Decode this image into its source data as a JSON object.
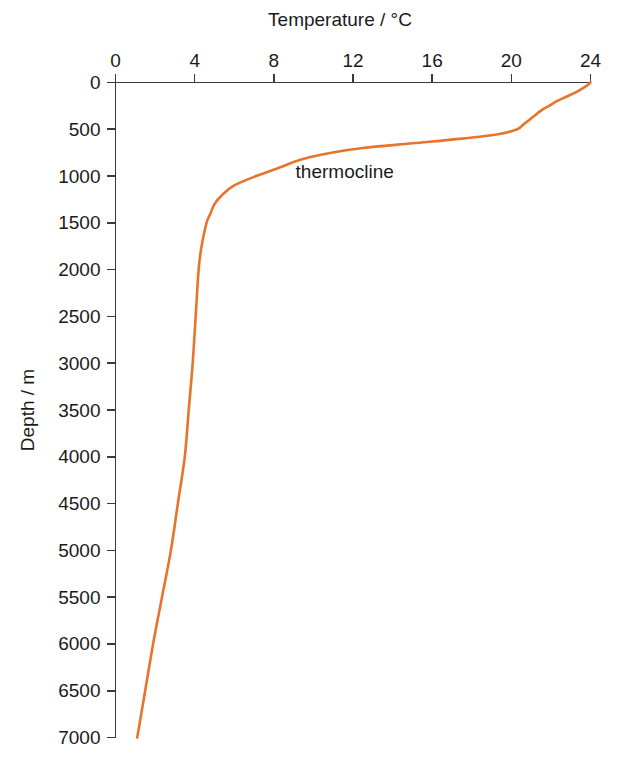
{
  "chart_data": {
    "type": "line",
    "title": "",
    "xlabel": "Temperature / °C",
    "ylabel": "Depth / m",
    "xlim": [
      0,
      24
    ],
    "ylim": [
      0,
      7000
    ],
    "y_inverted": true,
    "x_axis_position": "top",
    "grid": false,
    "legend": null,
    "xticks": [
      0,
      4,
      8,
      12,
      16,
      20,
      24
    ],
    "xtick_labels": [
      "0",
      "4",
      "8",
      "12",
      "16",
      "20",
      "24"
    ],
    "yticks": [
      0,
      500,
      1000,
      1500,
      2000,
      2500,
      3000,
      3500,
      4000,
      4500,
      5000,
      5500,
      6000,
      6500,
      7000
    ],
    "ytick_labels": [
      "0",
      "500",
      "1000",
      "1500",
      "2000",
      "2500",
      "3000",
      "3500",
      "4000",
      "4500",
      "5000",
      "5500",
      "6000",
      "6500",
      "7000"
    ],
    "series": [
      {
        "name": "ocean temperature profile",
        "color": "#E8742C",
        "x_name": "temperature_c",
        "y_name": "depth_m",
        "points": [
          {
            "depth_m": 0,
            "temperature_c": 24.0
          },
          {
            "depth_m": 50,
            "temperature_c": 23.7
          },
          {
            "depth_m": 100,
            "temperature_c": 23.3
          },
          {
            "depth_m": 150,
            "temperature_c": 22.8
          },
          {
            "depth_m": 200,
            "temperature_c": 22.3
          },
          {
            "depth_m": 250,
            "temperature_c": 21.9
          },
          {
            "depth_m": 300,
            "temperature_c": 21.5
          },
          {
            "depth_m": 350,
            "temperature_c": 21.2
          },
          {
            "depth_m": 400,
            "temperature_c": 20.9
          },
          {
            "depth_m": 450,
            "temperature_c": 20.6
          },
          {
            "depth_m": 500,
            "temperature_c": 20.3
          },
          {
            "depth_m": 550,
            "temperature_c": 19.4
          },
          {
            "depth_m": 600,
            "temperature_c": 17.5
          },
          {
            "depth_m": 650,
            "temperature_c": 15.0
          },
          {
            "depth_m": 700,
            "temperature_c": 12.5
          },
          {
            "depth_m": 750,
            "temperature_c": 10.9
          },
          {
            "depth_m": 800,
            "temperature_c": 9.8
          },
          {
            "depth_m": 850,
            "temperature_c": 9.0
          },
          {
            "depth_m": 900,
            "temperature_c": 8.4
          },
          {
            "depth_m": 1000,
            "temperature_c": 7.1
          },
          {
            "depth_m": 1100,
            "temperature_c": 6.0
          },
          {
            "depth_m": 1200,
            "temperature_c": 5.4
          },
          {
            "depth_m": 1300,
            "temperature_c": 5.0
          },
          {
            "depth_m": 1400,
            "temperature_c": 4.8
          },
          {
            "depth_m": 1500,
            "temperature_c": 4.6
          },
          {
            "depth_m": 1750,
            "temperature_c": 4.35
          },
          {
            "depth_m": 2000,
            "temperature_c": 4.2
          },
          {
            "depth_m": 2500,
            "temperature_c": 4.05
          },
          {
            "depth_m": 3000,
            "temperature_c": 3.9
          },
          {
            "depth_m": 3500,
            "temperature_c": 3.7
          },
          {
            "depth_m": 4000,
            "temperature_c": 3.5
          },
          {
            "depth_m": 4500,
            "temperature_c": 3.15
          },
          {
            "depth_m": 5000,
            "temperature_c": 2.8
          },
          {
            "depth_m": 5500,
            "temperature_c": 2.35
          },
          {
            "depth_m": 6000,
            "temperature_c": 1.9
          },
          {
            "depth_m": 6500,
            "temperature_c": 1.5
          },
          {
            "depth_m": 7000,
            "temperature_c": 1.1
          }
        ]
      }
    ],
    "annotations": [
      {
        "text": "thermocline",
        "temperature_c": 9.1,
        "depth_m": 1020
      }
    ]
  },
  "colors": {
    "curve": "#E8742C",
    "axis": "#3a3a3a",
    "text": "#1b1b1b",
    "background": "#ffffff"
  }
}
